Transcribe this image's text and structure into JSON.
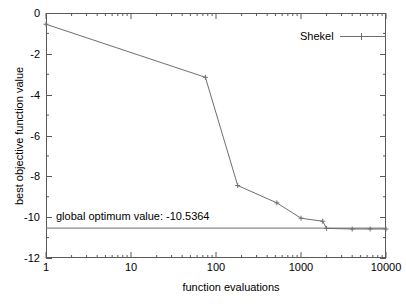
{
  "chart_data": {
    "type": "line",
    "title": "",
    "xlabel": "function evaluations",
    "ylabel": "best objective function value",
    "xscale": "log",
    "yscale": "linear",
    "xlim": [
      1,
      10000
    ],
    "ylim": [
      -12,
      0
    ],
    "grid": false,
    "legend_position": "top-right",
    "xticks": [
      "1",
      "10",
      "100",
      "1000",
      "10000"
    ],
    "xtick_values": [
      1,
      10,
      100,
      1000,
      10000
    ],
    "yticks": [
      "0",
      "-2",
      "-4",
      "-6",
      "-8",
      "-10",
      "-12"
    ],
    "ytick_values": [
      0,
      -2,
      -4,
      -6,
      -8,
      -10,
      -12
    ],
    "series": [
      {
        "name": "Shekel",
        "color": "#6e6e6e",
        "marker": "plus",
        "x": [
          1,
          75,
          180,
          520,
          1000,
          1800,
          2000,
          4000,
          6500,
          10000
        ],
        "y": [
          -0.55,
          -3.15,
          -8.45,
          -9.3,
          -10.05,
          -10.2,
          -10.55,
          -10.58,
          -10.58,
          -10.58
        ]
      }
    ],
    "reference_lines": [
      {
        "name": "global optimum",
        "label": "global optimum value: -10.5364",
        "value": -10.5364,
        "orientation": "horizontal",
        "color": "#6e6e6e"
      }
    ]
  },
  "legend": {
    "entries": [
      {
        "label": "Shekel"
      }
    ]
  },
  "annotations": {
    "optimum_text": "global optimum value: -10.5364"
  },
  "axes": {
    "x_title": "function evaluations",
    "y_title": "best objective function value"
  }
}
